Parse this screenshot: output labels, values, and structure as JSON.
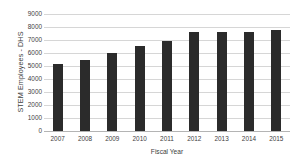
{
  "chart_data": {
    "type": "bar",
    "title": "",
    "xlabel": "Fiscal Year",
    "ylabel": "STEM Employees - DHS",
    "categories": [
      "2007",
      "2008",
      "2009",
      "2010",
      "2011",
      "2012",
      "2013",
      "2014",
      "2015"
    ],
    "values": [
      5150,
      5460,
      6000,
      6540,
      6920,
      7600,
      7650,
      7600,
      7770
    ],
    "ylim": [
      0,
      9000
    ],
    "ytick_labels": [
      "9000",
      "8000",
      "7000",
      "6000",
      "5000",
      "4000",
      "3000",
      "2000",
      "1000",
      "0"
    ],
    "ytick_values": [
      9000,
      8000,
      7000,
      6000,
      5000,
      4000,
      3000,
      2000,
      1000,
      0
    ],
    "grid": true,
    "legend": "none",
    "bar_color": "#2b2b2b",
    "grid_color": "#d6d6d6",
    "background_color": "#ffffff"
  }
}
